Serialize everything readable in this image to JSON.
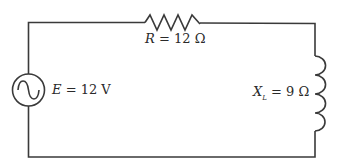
{
  "diagram": {
    "type": "series RL AC circuit",
    "components": {
      "source": {
        "symbol": "ac-voltage-source",
        "var": "E",
        "eq": "= 12 V"
      },
      "resistor": {
        "symbol": "resistor",
        "var": "R",
        "eq": "= 12 Ω"
      },
      "inductor": {
        "symbol": "inductor",
        "var": "X",
        "sub": "L",
        "eq": "= 9 Ω"
      }
    },
    "colors": {
      "wire": "#3a3a3a",
      "background": "#ffffff"
    }
  }
}
